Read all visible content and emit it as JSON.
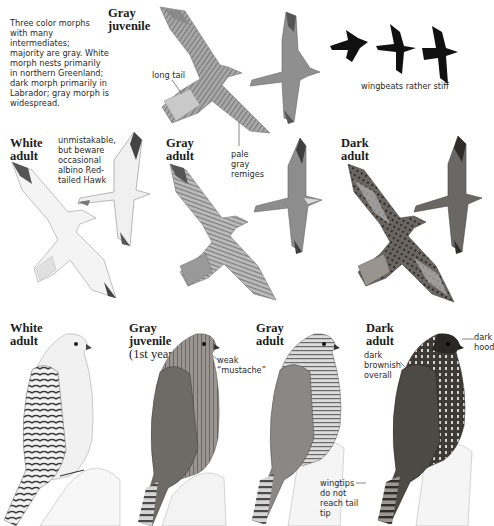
{
  "intro": {
    "text_lines": [
      "Three color morphs",
      "with many intermediates;",
      "majority are gray. White",
      "morph nests primarily",
      "in northern Greenland;",
      "dark morph primarily in",
      "Labrador; gray morph is",
      "widespread."
    ]
  },
  "flight_row_1": {
    "heading": [
      "Gray",
      "juvenile"
    ],
    "labels": {
      "long_tail": "long tail",
      "wingbeats": "wingbeats rather stiff"
    }
  },
  "flight_row_2": {
    "white_adult": {
      "heading": [
        "White",
        "adult"
      ],
      "note_lines": [
        "unmistakable,",
        "but beware",
        "occasional",
        "albino Red-",
        "tailed Hawk"
      ]
    },
    "gray_adult": {
      "heading": [
        "Gray",
        "adult"
      ],
      "note_lines": [
        "pale",
        "gray",
        "remiges"
      ]
    },
    "dark_adult": {
      "heading": [
        "Dark",
        "adult"
      ]
    }
  },
  "perched_row": {
    "white_adult": {
      "heading": [
        "White",
        "adult"
      ]
    },
    "gray_juvenile": {
      "heading": [
        "Gray",
        "juvenile"
      ],
      "subheading": "(1st year)",
      "note_lines": [
        "weak",
        "“mustache”"
      ]
    },
    "gray_adult": {
      "heading": [
        "Gray",
        "adult"
      ],
      "note_lines": [
        "wingtips",
        "do not",
        "reach tail",
        "tip"
      ]
    },
    "dark_adult": {
      "heading": [
        "Dark",
        "adult"
      ],
      "note_dark_hood": [
        "dark",
        "hood"
      ],
      "note_brownish": [
        "dark",
        "brownish",
        "overall"
      ]
    }
  },
  "colors": {
    "background": "#ffffff",
    "text": "#2a2a2a",
    "white_morph": "#eeeeee",
    "gray_morph": "#8e8e8e",
    "dark_morph": "#4a4744",
    "silhouette": "#111111"
  }
}
